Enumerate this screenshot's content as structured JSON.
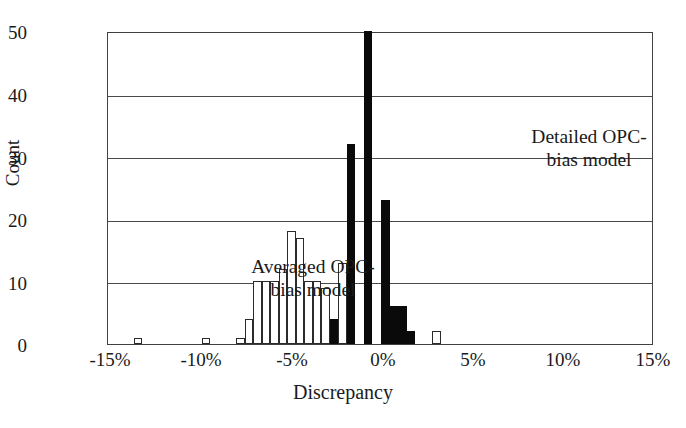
{
  "chart_data": {
    "type": "bar",
    "title": "",
    "subtitle": "",
    "xlabel": "Discrepancy",
    "ylabel": "Count",
    "xlim": [
      -16.0,
      16.0
    ],
    "ylim": [
      0,
      50
    ],
    "xticks": [
      "-15%",
      "-10%",
      "-5%",
      "0%",
      "5%",
      "10%",
      "15%"
    ],
    "xtick_values": [
      -15,
      -10,
      -5,
      0,
      5,
      10,
      15
    ],
    "yticks": [
      "0",
      "10",
      "20",
      "30",
      "40",
      "50"
    ],
    "ytick_values": [
      0,
      10,
      20,
      30,
      40,
      50
    ],
    "grid": "horizontal",
    "legend_position": "in-plot-annotations",
    "bin_width": 0.5,
    "series": [
      {
        "name": "Averaged OPC-bias model",
        "color": "#ffffff",
        "edge_color": "#2b2b2b",
        "style": "open/white bars",
        "bins": [
          {
            "x": -14.5,
            "value": 1
          },
          {
            "x": -10.5,
            "value": 1
          },
          {
            "x": -8.5,
            "value": 1
          },
          {
            "x": -8.0,
            "value": 4
          },
          {
            "x": -7.5,
            "value": 10
          },
          {
            "x": -7.0,
            "value": 10
          },
          {
            "x": -6.5,
            "value": 10
          },
          {
            "x": -6.0,
            "value": 12
          },
          {
            "x": -5.5,
            "value": 18
          },
          {
            "x": -5.0,
            "value": 17
          },
          {
            "x": -4.5,
            "value": 10
          },
          {
            "x": -4.0,
            "value": 10
          },
          {
            "x": -3.5,
            "value": 9
          },
          {
            "x": -3.0,
            "value": 4
          },
          {
            "x": -2.5,
            "value": 13
          },
          {
            "x": -2.0,
            "value": 15
          },
          {
            "x": -1.0,
            "value": 4
          },
          {
            "x": 0.0,
            "value": 6
          },
          {
            "x": 0.5,
            "value": 4
          },
          {
            "x": 1.0,
            "value": 3
          },
          {
            "x": 1.5,
            "value": 1
          },
          {
            "x": 3.0,
            "value": 2
          }
        ]
      },
      {
        "name": "Detailed OPC-bias model",
        "color": "#0a0a0a",
        "edge_color": "#0a0a0a",
        "style": "filled/black bars",
        "bins": [
          {
            "x": -3.0,
            "value": 4
          },
          {
            "x": -2.0,
            "value": 32
          },
          {
            "x": -1.0,
            "value": 50
          },
          {
            "x": 0.0,
            "value": 23
          },
          {
            "x": 0.5,
            "value": 6
          },
          {
            "x": 1.0,
            "value": 6
          },
          {
            "x": 1.5,
            "value": 2
          }
        ]
      }
    ],
    "annotations": [
      {
        "name": "averaged-model-label",
        "text": "Averaged OPC-\nbias model",
        "x": -11.0,
        "y": 17
      },
      {
        "name": "detailed-model-label",
        "text": "Detailed OPC-\nbias model",
        "x": 1.5,
        "y": 40
      }
    ]
  },
  "axes": {
    "ylabel": "Count",
    "xlabel": "Discrepancy"
  },
  "notes": {
    "averaged": "Averaged OPC-\nbias model",
    "detailed": "Detailed OPC-\nbias model"
  }
}
